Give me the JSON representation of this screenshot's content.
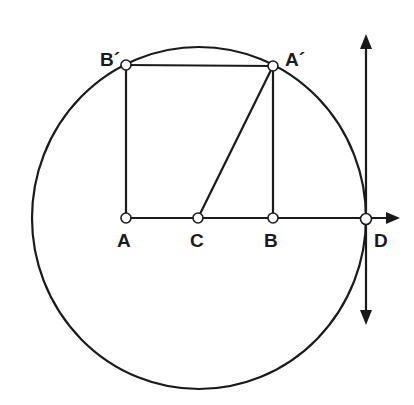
{
  "diagram": {
    "points": {
      "A": {
        "label": "A"
      },
      "C": {
        "label": "C"
      },
      "B": {
        "label": "B"
      },
      "D": {
        "label": "D"
      },
      "A_prime": {
        "label": "A´"
      },
      "B_prime": {
        "label": "B´"
      }
    },
    "segments": [
      {
        "from": "A",
        "to": "B_prime"
      },
      {
        "from": "B_prime",
        "to": "A_prime"
      },
      {
        "from": "A_prime",
        "to": "B"
      },
      {
        "from": "C",
        "to": "A_prime"
      }
    ],
    "axis": {
      "name": "horizontal axis through A, C, B, D",
      "direction": "right"
    },
    "tangent": {
      "name": "vertical line through D",
      "direction": "both"
    },
    "circle": {
      "center": "C",
      "through": [
        "A_prime",
        "B_prime",
        "D"
      ]
    },
    "colors": {
      "ink": "#1a1a1a",
      "background": "#ffffff",
      "point_fill": "#ffffff"
    }
  }
}
